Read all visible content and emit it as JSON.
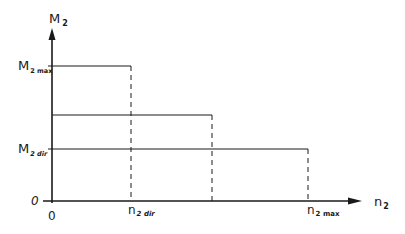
{
  "diagram": {
    "y_axis_label": {
      "main": "M",
      "sub": "2"
    },
    "x_axis_label": {
      "main": "n",
      "sub": "2"
    },
    "origin_y": "0",
    "origin_x": "0",
    "y_ticks": [
      {
        "main": "M",
        "sub": "2 max"
      },
      {
        "main": "M",
        "sub": "2 dir"
      }
    ],
    "x_ticks": [
      {
        "main": "n",
        "sub": "2 dir"
      },
      {
        "main": "n",
        "sub": "2 max"
      }
    ],
    "levels": [
      {
        "name": "level-max",
        "y_label": "M2max",
        "x_end_label": "n2dir"
      },
      {
        "name": "level-mid",
        "y_label": "",
        "x_end_label": ""
      },
      {
        "name": "level-dir",
        "y_label": "M2dir",
        "x_end_label": "n2max"
      }
    ],
    "colors": {
      "line": "#1a1a1a",
      "background": "#ffffff"
    }
  }
}
